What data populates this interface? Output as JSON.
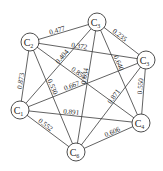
{
  "diagram": {
    "type": "complete-weighted-graph",
    "nodes": [
      {
        "id": "C1",
        "label": "C",
        "sub": "1",
        "x": 20,
        "y": 110
      },
      {
        "id": "C2",
        "label": "C",
        "sub": "2",
        "x": 30,
        "y": 42
      },
      {
        "id": "C3",
        "label": "C",
        "sub": "3",
        "x": 97,
        "y": 22
      },
      {
        "id": "C4",
        "label": "C",
        "sub": "3",
        "x": 146,
        "y": 60
      },
      {
        "id": "C5",
        "label": "C",
        "sub": "4",
        "x": 141,
        "y": 123
      },
      {
        "id": "C6",
        "label": "C",
        "sub": "6",
        "x": 76,
        "y": 152
      }
    ],
    "edges": [
      {
        "from": "C2",
        "to": "C3",
        "weight": "0.477"
      },
      {
        "from": "C2",
        "to": "C4",
        "weight": "0.372"
      },
      {
        "from": "C3",
        "to": "C4",
        "weight": "0.235"
      },
      {
        "from": "C3",
        "to": "C5",
        "weight": "0.640"
      },
      {
        "from": "C3",
        "to": "C6",
        "weight": "0.634"
      },
      {
        "from": "C3",
        "to": "C1",
        "weight": "0.404"
      },
      {
        "from": "C1",
        "to": "C2",
        "weight": "0.873"
      },
      {
        "from": "C1",
        "to": "C4",
        "weight": "0.667"
      },
      {
        "from": "C2",
        "to": "C5",
        "weight": "0.855"
      },
      {
        "from": "C4",
        "to": "C5",
        "weight": "0.550"
      },
      {
        "from": "C4",
        "to": "C6",
        "weight": "0.871"
      },
      {
        "from": "C1",
        "to": "C5",
        "weight": "0.891"
      },
      {
        "from": "C2",
        "to": "C6",
        "weight": "0.530"
      },
      {
        "from": "C1",
        "to": "C6",
        "weight": "0.552"
      },
      {
        "from": "C5",
        "to": "C6",
        "weight": "0.606"
      }
    ]
  }
}
